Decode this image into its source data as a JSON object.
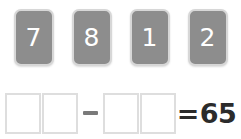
{
  "puzzle": {
    "type": "number-tile-equation",
    "tiles": [
      {
        "digit": "7"
      },
      {
        "digit": "8"
      },
      {
        "digit": "1"
      },
      {
        "digit": "2"
      }
    ],
    "equation": {
      "left_operand_slots": [
        "",
        ""
      ],
      "operator": "−",
      "right_operand_slots": [
        "",
        ""
      ],
      "equals_sign": "=",
      "result": "65"
    },
    "colors": {
      "tile_fill": "#8d8d8d",
      "tile_border": "#d7d7d7",
      "tile_digit": "#ffffff",
      "slot_border": "#dedede",
      "slot_fill": "#ffffff",
      "operator": "#7a7a7a",
      "result_text": "#2b2b2b",
      "page_background": "#ffffff"
    }
  }
}
